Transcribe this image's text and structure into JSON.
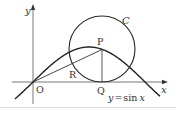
{
  "diagram": {
    "type": "geometry-figure",
    "axes": {
      "x_label": "x",
      "y_label": "y",
      "origin_label": "O"
    },
    "curve": {
      "label": "y = sin x",
      "equation_lhs": "y",
      "equation_eq": "=",
      "equation_fn": "sin",
      "equation_var": "x"
    },
    "circle": {
      "label": "C"
    },
    "points": {
      "P": "P",
      "Q": "Q",
      "R": "R",
      "O": "O"
    },
    "colors": {
      "stroke": "#2a2a2a",
      "axis": "#555555",
      "text": "#333333",
      "rule": "#d8d8d8"
    }
  }
}
